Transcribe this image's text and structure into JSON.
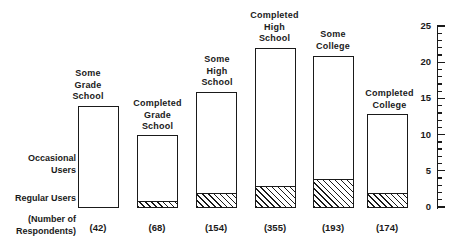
{
  "chart_data": {
    "type": "bar",
    "title": "",
    "subtitle": "",
    "xlabel": "",
    "ylabel": "",
    "ylim": [
      0,
      25
    ],
    "grid": false,
    "legend_position": "left-axis-annotations",
    "stacked": true,
    "categories": [
      "Some Grade School",
      "Completed Grade School",
      "Some High School",
      "Completed High School",
      "Some College",
      "Completed College"
    ],
    "category_label_lines": [
      [
        "Some",
        "Grade",
        "School"
      ],
      [
        "Completed",
        "Grade",
        "School"
      ],
      [
        "Some",
        "High",
        "School"
      ],
      [
        "Completed",
        "High",
        "School"
      ],
      [
        "Some",
        "College"
      ],
      [
        "Completed",
        "College"
      ]
    ],
    "series": [
      {
        "name": "Regular Users",
        "values": [
          0,
          1,
          2,
          3,
          4,
          2
        ]
      },
      {
        "name": "Occasional Users",
        "values": [
          14,
          9,
          14,
          19,
          17,
          11
        ]
      }
    ],
    "totals": [
      14,
      10,
      16,
      22,
      21,
      13
    ],
    "respondents": [
      "(42)",
      "(68)",
      "(154)",
      "(355)",
      "(193)",
      "(174)"
    ],
    "yticks_major": [
      0,
      5,
      10,
      15,
      20,
      25
    ],
    "ytick_labels": [
      "0",
      "5",
      "10",
      "15",
      "20",
      "25"
    ],
    "ytick_minor_step": 1,
    "annotations": {
      "occasional_users": "Occasional\nUsers",
      "occasional_users_line1": "Occasional",
      "occasional_users_line2": "Users",
      "regular_users": "Regular Users",
      "respondents_line1": "(Number of",
      "respondents_line2": "Respondents)"
    },
    "colors": {
      "ink": "#1a1a1a",
      "background": "#ffffff",
      "bar_fill": "#ffffff",
      "hatch": "#1a1a1a"
    }
  }
}
